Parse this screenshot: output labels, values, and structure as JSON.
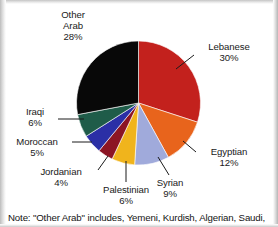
{
  "chart_data": {
    "type": "pie",
    "title": "",
    "subtitle": "",
    "xlabel": "",
    "ylabel": "",
    "legend_position": "none",
    "grid": false,
    "unit": "%",
    "start_angle_deg": 0,
    "direction": "clockwise",
    "categories": [
      "Lebanese",
      "Egyptian",
      "Syrian",
      "Palestinian",
      "Jordanian",
      "Moroccan",
      "Iraqi",
      "Other Arab"
    ],
    "values": [
      30,
      12,
      9,
      6,
      4,
      5,
      6,
      28
    ],
    "slices": [
      {
        "label": "Lebanese",
        "value": 30,
        "value_text": "30%",
        "color": "#c3211d"
      },
      {
        "label": "Egyptian",
        "value": 12,
        "value_text": "12%",
        "color": "#e8641c"
      },
      {
        "label": "Syrian",
        "value": 9,
        "value_text": "9%",
        "color": "#a0aadb"
      },
      {
        "label": "Palestinian",
        "value": 6,
        "value_text": "6%",
        "color": "#f0b41c"
      },
      {
        "label": "Jordanian",
        "value": 4,
        "value_text": "4%",
        "color": "#8c1524"
      },
      {
        "label": "Moroccan",
        "value": 5,
        "value_text": "5%",
        "color": "#2b2fa6"
      },
      {
        "label": "Iraqi",
        "value": 6,
        "value_text": "6%",
        "color": "#1f5c49"
      },
      {
        "label": "Other Arab",
        "value": 28,
        "value_text": "28%",
        "color": "#080808"
      }
    ],
    "annotations": [
      "Note: \"Other Arab\" includes, Yemeni, Kurdish, Algerian, Saudi,"
    ]
  },
  "labels": {
    "other_arab": {
      "line1": "Other",
      "line2": "Arab",
      "pct": "28%"
    },
    "lebanese": {
      "name": "Lebanese",
      "pct": "30%"
    },
    "egyptian": {
      "name": "Egyptian",
      "pct": "12%"
    },
    "syrian": {
      "name": "Syrian",
      "pct": "9%"
    },
    "palestinian": {
      "name": "Palestinian",
      "pct": "6%"
    },
    "jordanian": {
      "name": "Jordanian",
      "pct": "4%"
    },
    "moroccan": {
      "name": "Moroccan",
      "pct": "5%"
    },
    "iraqi": {
      "name": "Iraqi",
      "pct": "6%"
    }
  },
  "note": {
    "text": "Note: \"Other Arab\" includes, Yemeni, Kurdish, Algerian, Saudi,"
  },
  "colors": {
    "background": "#ffffff",
    "text": "#1a1a1a",
    "leader_line": "#1a1a1a"
  }
}
